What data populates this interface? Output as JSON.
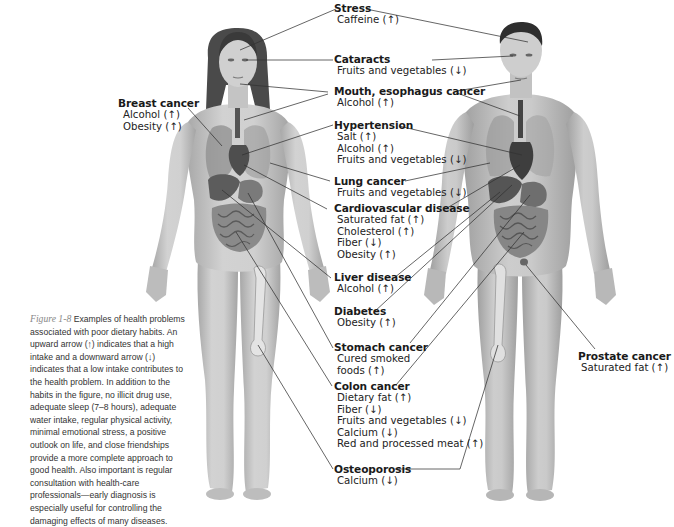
{
  "figure": {
    "number": "Figure 1-8",
    "caption": "Examples of health problems associated with poor dietary habits. An upward arrow (↑) indicates that a high intake and a downward arrow (↓) indicates that a low intake contributes to the health problem. In addition to the habits in the figure, no illicit drug use, adequate sleep (7–8 hours), adequate water intake, regular physical activity, minimal emotional stress, a positive outlook on life, and close friendships provide a more complete approach to good health. Also important is regular consultation with health-care professionals—early diagnosis is especially useful for controlling the damaging effects of many diseases."
  },
  "illustrations": {
    "left": "female-body-anatomy",
    "right": "male-body-anatomy"
  },
  "colors": {
    "skin": "#c9c9c9",
    "skin_shadow": "#a9a9a9",
    "hair": "#3a3a3a",
    "organ_dark": "#555555",
    "organ_mid": "#8a8a8a",
    "leader_line": "#333333"
  },
  "conditions": [
    {
      "id": "stress",
      "name": "Stress",
      "factors": [
        "Caffeine (↑)"
      ]
    },
    {
      "id": "cataracts",
      "name": "Cataracts",
      "factors": [
        "Fruits and vegetables (↓)"
      ]
    },
    {
      "id": "mouth-esophagus",
      "name": "Mouth, esophagus cancer",
      "factors": [
        "Alcohol (↑)"
      ]
    },
    {
      "id": "hypertension",
      "name": "Hypertension",
      "factors": [
        "Salt (↑)",
        "Alcohol (↑)",
        "Fruits and vegetables (↓)"
      ]
    },
    {
      "id": "lung-cancer",
      "name": "Lung cancer",
      "factors": [
        "Fruits and vegetables (↓)"
      ]
    },
    {
      "id": "cardiovascular",
      "name": "Cardiovascular disease",
      "factors": [
        "Saturated fat (↑)",
        "Cholesterol (↑)",
        "Fiber (↓)",
        "Obesity (↑)"
      ]
    },
    {
      "id": "liver",
      "name": "Liver disease",
      "factors": [
        "Alcohol (↑)"
      ]
    },
    {
      "id": "diabetes",
      "name": "Diabetes",
      "factors": [
        "Obesity (↑)"
      ]
    },
    {
      "id": "stomach",
      "name": "Stomach cancer",
      "factors": [
        "Cured smoked",
        "foods (↑)"
      ]
    },
    {
      "id": "colon",
      "name": "Colon cancer",
      "factors": [
        "Dietary fat (↑)",
        "Fiber (↓)",
        "Fruits and vegetables (↓)",
        "Calcium (↓)",
        "Red and processed meat (↑)"
      ]
    },
    {
      "id": "osteoporosis",
      "name": "Osteoporosis",
      "factors": [
        "Calcium (↓)"
      ]
    },
    {
      "id": "breast",
      "name": "Breast cancer",
      "factors": [
        "Alcohol (↑)",
        "Obesity (↑)"
      ]
    },
    {
      "id": "prostate",
      "name": "Prostate cancer",
      "factors": [
        "Saturated fat (↑)"
      ]
    }
  ]
}
